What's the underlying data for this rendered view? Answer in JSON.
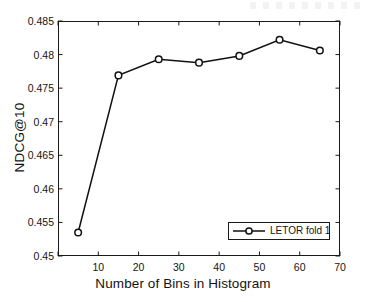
{
  "chart_data": {
    "type": "line",
    "title": "",
    "xlabel": "Number of Bins in Histogram",
    "ylabel": "NDCG@10",
    "xlim": [
      0,
      70
    ],
    "ylim": [
      0.45,
      0.485
    ],
    "xticks": [
      0,
      10,
      20,
      30,
      40,
      50,
      60,
      70
    ],
    "xtick_labels": [
      "",
      "10",
      "20",
      "30",
      "40",
      "50",
      "60",
      "70"
    ],
    "yticks": [
      0.45,
      0.455,
      0.46,
      0.465,
      0.47,
      0.475,
      0.48,
      0.485
    ],
    "ytick_labels": [
      "0.45",
      "0.455",
      "0.46",
      "0.465",
      "0.47",
      "0.475",
      "0.48",
      "0.485"
    ],
    "grid": false,
    "legend_position": "lower right",
    "series": [
      {
        "name": "LETOR fold 1",
        "marker": "circle",
        "color": "#111111",
        "x": [
          5,
          15,
          25,
          35,
          45,
          55,
          65
        ],
        "values": [
          0.4535,
          0.4769,
          0.4793,
          0.4788,
          0.4798,
          0.4822,
          0.4806
        ]
      }
    ]
  },
  "legend": {
    "entries": [
      {
        "label": "LETOR fold 1"
      }
    ]
  },
  "axes": {
    "y_label": "NDCG@10",
    "x_label": "Number of Bins in Histogram"
  }
}
